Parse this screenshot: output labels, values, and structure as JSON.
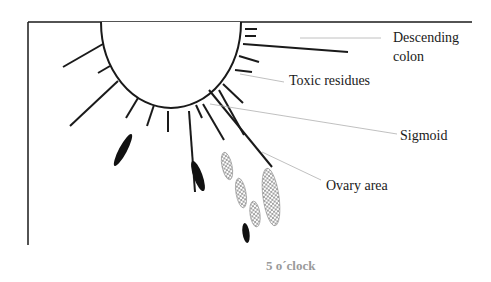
{
  "diagram": {
    "labels": {
      "descending_colon_line1": "Descending",
      "descending_colon_line2": "colon",
      "toxic_residues": "Toxic residues",
      "sigmoid": "Sigmoid",
      "ovary_area": "Ovary area"
    },
    "caption": "5 o´clock",
    "colors": {
      "stroke": "#1a1a1a",
      "leader_line": "#b0b0b0",
      "caption": "#9a9a9a",
      "hatch": "#7a7a7a"
    }
  }
}
